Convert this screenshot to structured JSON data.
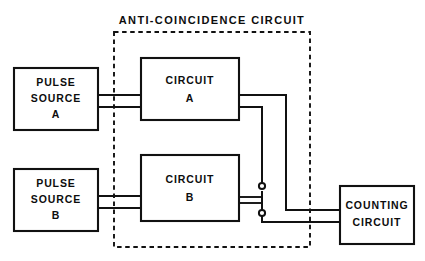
{
  "diagram": {
    "title": "ANTI-COINCIDENCE CIRCUIT",
    "type": "block-diagram",
    "background_color": "#ffffff",
    "line_color": "#111111",
    "blocks": [
      {
        "id": "pulse-source-a",
        "lines": [
          "PULSE",
          "SOURCE",
          "A"
        ]
      },
      {
        "id": "pulse-source-b",
        "lines": [
          "PULSE",
          "SOURCE",
          "B"
        ]
      },
      {
        "id": "circuit-a",
        "lines": [
          "CIRCUIT",
          "A"
        ]
      },
      {
        "id": "circuit-b",
        "lines": [
          "CIRCUIT",
          "B"
        ]
      },
      {
        "id": "counting-circuit",
        "lines": [
          "COUNTING",
          "CIRCUIT"
        ]
      }
    ],
    "enclosure": {
      "label": "ANTI-COINCIDENCE CIRCUIT",
      "style": "dashed",
      "encloses": [
        "circuit-a",
        "circuit-b",
        "switch"
      ]
    },
    "switch": {
      "type": "spdt-toggle",
      "contacts": 2,
      "contact_style": "open-circle"
    },
    "connections": [
      {
        "from": "pulse-source-a",
        "to": "circuit-a",
        "conductors": 2
      },
      {
        "from": "pulse-source-b",
        "to": "circuit-b",
        "conductors": 2
      },
      {
        "from": "circuit-a",
        "to": "counting-circuit",
        "conductors": 1
      },
      {
        "from": "circuit-a",
        "to": "switch",
        "conductors": 1
      },
      {
        "from": "switch",
        "to": "circuit-b",
        "conductors": 1,
        "arrow": true
      },
      {
        "from": "switch",
        "to": "counting-circuit",
        "conductors": 1
      }
    ]
  },
  "labels": {
    "title": "ANTI-COINCIDENCE CIRCUIT",
    "pulse_source_a": {
      "l1": "PULSE",
      "l2": "SOURCE",
      "l3": "A"
    },
    "pulse_source_b": {
      "l1": "PULSE",
      "l2": "SOURCE",
      "l3": "B"
    },
    "circuit_a": {
      "l1": "CIRCUIT",
      "l2": "A"
    },
    "circuit_b": {
      "l1": "CIRCUIT",
      "l2": "B"
    },
    "counting_circuit": {
      "l1": "COUNTING",
      "l2": "CIRCUIT"
    }
  }
}
